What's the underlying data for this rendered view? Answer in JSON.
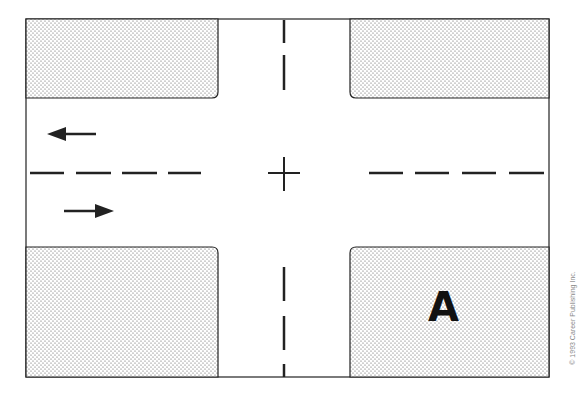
{
  "diagram": {
    "type": "intersection",
    "colors": {
      "line": "#222222",
      "fill_dots": "#555555",
      "background": "#ffffff"
    },
    "blocks": [
      {
        "id": "top-left"
      },
      {
        "id": "top-right"
      },
      {
        "id": "bottom-left"
      },
      {
        "id": "bottom-right",
        "label": "A"
      }
    ],
    "arrows": [
      {
        "id": "upper-lane",
        "direction": "left"
      },
      {
        "id": "lower-lane",
        "direction": "right"
      }
    ],
    "center_marker": "+",
    "copyright": "© 1993 Career Publishing Inc."
  }
}
